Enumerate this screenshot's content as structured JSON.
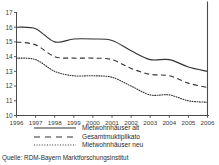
{
  "chart_data": {
    "type": "line",
    "title": "",
    "xlabel": "",
    "ylabel": "",
    "x": [
      1996,
      1997,
      1998,
      1999,
      2000,
      2001,
      2002,
      2003,
      2004,
      2005,
      2006
    ],
    "categories": [
      "1996",
      "1997",
      "1998",
      "1999",
      "2000",
      "2001",
      "2002",
      "2003",
      "2004",
      "2005",
      "2006"
    ],
    "xlim": [
      1996,
      2006
    ],
    "ylim": [
      10,
      17
    ],
    "yticks": [
      10,
      11,
      12,
      13,
      14,
      15,
      16,
      17
    ],
    "xticks": [
      "1996",
      "1997",
      "1998",
      "1999",
      "2000",
      "2001",
      "2002",
      "2003",
      "2004",
      "2005",
      "2006"
    ],
    "grid": false,
    "legend_position": "below",
    "series": [
      {
        "name": "Mietwohnhäuser alt",
        "style": "solid",
        "color": "#333333",
        "values": [
          16.0,
          15.9,
          15.0,
          15.2,
          15.2,
          15.1,
          14.4,
          13.8,
          13.8,
          13.3,
          13.0
        ]
      },
      {
        "name": "Gesamtmuktiplikato",
        "style": "dashed",
        "color": "#333333",
        "values": [
          15.0,
          14.8,
          14.0,
          13.9,
          13.9,
          13.8,
          13.2,
          12.8,
          12.7,
          12.2,
          11.9
        ]
      },
      {
        "name": "Mietwohnhäuser neu",
        "style": "dotted",
        "color": "#333333",
        "values": [
          13.9,
          13.8,
          13.0,
          12.7,
          12.7,
          12.6,
          12.0,
          11.4,
          11.4,
          11.0,
          10.9
        ]
      }
    ]
  },
  "legend": {
    "items": [
      {
        "label": "Mietwohnhäuser alt",
        "style": "solid"
      },
      {
        "label": "Gesamtmuktiplikato",
        "style": "dashed"
      },
      {
        "label": "Mietwohnhäuser neu",
        "style": "dotted"
      }
    ]
  },
  "source": {
    "text": "Quelle: RDM-Bayern Marktforschungsinstitut"
  }
}
